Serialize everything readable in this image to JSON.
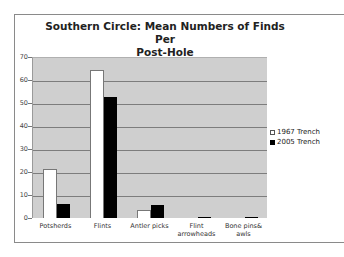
{
  "chart_data": {
    "type": "bar",
    "title": "Southern Circle: Mean Numbers of Finds Per Post-Hole",
    "title_lines": [
      "Southern Circle: Mean Numbers of Finds Per",
      "Post-Hole"
    ],
    "categories": [
      "Potsherds",
      "Flints",
      "Antler picks",
      "Flint arrowheads",
      "Bone pins& awls"
    ],
    "category_lines": [
      [
        "Potsherds"
      ],
      [
        "Flints"
      ],
      [
        "Antler picks"
      ],
      [
        "Flint",
        "arrowheads"
      ],
      [
        "Bone pins&",
        "awls"
      ]
    ],
    "series": [
      {
        "name": "1967 Trench",
        "color": "#ffffff",
        "values": [
          21.3,
          64.3,
          3.5,
          0,
          0
        ]
      },
      {
        "name": "2005 Trench",
        "color": "#000000",
        "values": [
          6,
          52.6,
          5.5,
          0.5,
          0.5
        ]
      }
    ],
    "xlabel": "",
    "ylabel": "",
    "ylim": [
      0,
      70
    ],
    "yticks": [
      "0",
      "10",
      "20",
      "30",
      "40",
      "50",
      "60",
      "70"
    ],
    "grid": true,
    "legend_position": "right",
    "plot_background": "#cfcfcf"
  }
}
